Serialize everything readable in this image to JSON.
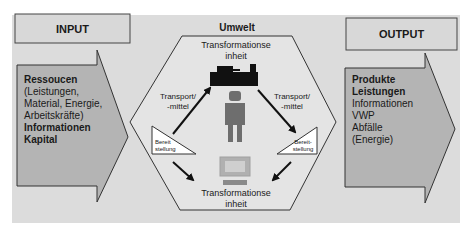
{
  "diagram": {
    "environment_label": "Umwelt",
    "input": {
      "title": "INPUT",
      "lines": [
        {
          "text": "Ressoucen",
          "bold": true
        },
        {
          "text": "(Leistungen,",
          "bold": false
        },
        {
          "text": "Material, Energie,",
          "bold": false
        },
        {
          "text": "Arbeitskräfte)",
          "bold": false
        },
        {
          "text": "Informationen",
          "bold": true
        },
        {
          "text": "Kapital",
          "bold": true
        }
      ]
    },
    "output": {
      "title": "OUTPUT",
      "lines": [
        {
          "text": "Produkte",
          "bold": true
        },
        {
          "text": "Leistungen",
          "bold": true
        },
        {
          "text": "Informationen",
          "bold": false
        },
        {
          "text": "VWP",
          "bold": false
        },
        {
          "text": "Abfälle",
          "bold": false
        },
        {
          "text": "(Energie)",
          "bold": false
        }
      ]
    },
    "center": {
      "top_unit": {
        "line1": "Transformationse",
        "line2": "inheit",
        "icon": "machine-icon"
      },
      "bottom_unit": {
        "line1": "Transformationse",
        "line2": "inheit",
        "icon": "computer-icon"
      },
      "person_icon": "person-icon",
      "transport_left": {
        "line1": "Transport/",
        "line2": "-mittel"
      },
      "transport_right": {
        "line1": "Transport/",
        "line2": "-mittel"
      },
      "provision_left": {
        "line1": "Bereit",
        "line2": "stellung"
      },
      "provision_right": {
        "line1": "Bereit-",
        "line2": "stellung"
      }
    },
    "colors": {
      "background": "#dcdcdc",
      "arrow_fill": "#b4b4b4",
      "hexagon_fill": "#e4e4e4",
      "box_fill": "#d8d8d8",
      "machine": "#111111",
      "person": "#6e6e6e",
      "computer": "#a0a0a0",
      "stroke": "#333333"
    }
  }
}
